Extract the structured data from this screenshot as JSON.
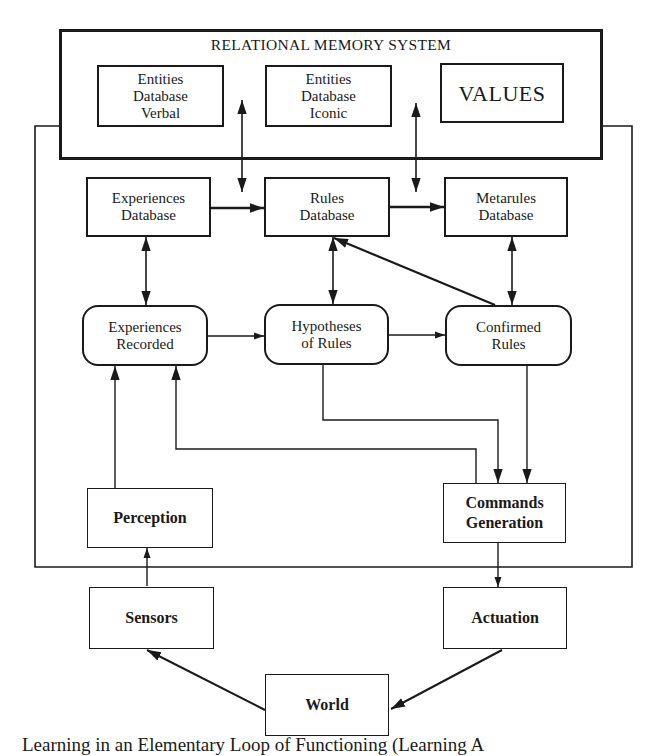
{
  "diagram": {
    "memory_system": {
      "title": "RELATIONAL MEMORY SYSTEM",
      "entities_verbal": "Entities\nDatabase\nVerbal",
      "entities_iconic": "Entities\nDatabase\nIconic",
      "values": "VALUES"
    },
    "databases": {
      "experiences": "Experiences\nDatabase",
      "rules": "Rules\nDatabase",
      "metarules": "Metarules\nDatabase"
    },
    "processes": {
      "experiences_recorded": "Experiences\nRecorded",
      "hypotheses_of_rules": "Hypotheses\nof Rules",
      "confirmed_rules": "Confirmed\nRules"
    },
    "io": {
      "perception": "Perception",
      "commands_generation": "Commands\nGeneration",
      "sensors": "Sensors",
      "actuation": "Actuation",
      "world": "World"
    },
    "edges": [
      {
        "from": "Entities Database Verbal / Entities Database Iconic",
        "to": "Rules Database",
        "type": "bidirectional"
      },
      {
        "from": "Entities Database Iconic / VALUES",
        "to": "Rules Database / Metarules Database",
        "type": "bidirectional"
      },
      {
        "from": "Experiences Database",
        "to": "Rules Database",
        "type": "directed"
      },
      {
        "from": "Rules Database",
        "to": "Metarules Database",
        "type": "directed"
      },
      {
        "from": "Experiences Database",
        "to": "Experiences Recorded",
        "type": "bidirectional"
      },
      {
        "from": "Rules Database",
        "to": "Hypotheses of Rules",
        "type": "bidirectional"
      },
      {
        "from": "Metarules Database",
        "to": "Confirmed Rules",
        "type": "bidirectional"
      },
      {
        "from": "Confirmed Rules",
        "to": "Rules Database",
        "type": "directed"
      },
      {
        "from": "Experiences Recorded",
        "to": "Hypotheses of Rules",
        "type": "directed"
      },
      {
        "from": "Hypotheses of Rules",
        "to": "Confirmed Rules",
        "type": "directed"
      },
      {
        "from": "Hypotheses of Rules",
        "to": "Commands Generation",
        "type": "directed"
      },
      {
        "from": "Confirmed Rules",
        "to": "Commands Generation",
        "type": "directed"
      },
      {
        "from": "Commands Generation",
        "to": "Experiences Recorded",
        "type": "directed"
      },
      {
        "from": "Perception",
        "to": "Experiences Recorded",
        "type": "directed"
      },
      {
        "from": "Sensors",
        "to": "Perception",
        "type": "directed"
      },
      {
        "from": "Commands Generation",
        "to": "Actuation",
        "type": "directed"
      },
      {
        "from": "Actuation",
        "to": "World",
        "type": "directed"
      },
      {
        "from": "World",
        "to": "Sensors",
        "type": "directed"
      }
    ]
  },
  "caption": "Learning in an Elementary Loop of Functioning (Learning A"
}
